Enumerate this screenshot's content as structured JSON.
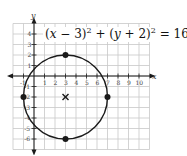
{
  "chart_data": {
    "type": "scatter",
    "equation": {
      "parts": [
        "(",
        "x",
        " − 3)",
        "2",
        " + (",
        "y",
        " + 2)",
        "2",
        " = 16"
      ]
    },
    "xlabel": "x",
    "ylabel": "y",
    "xlim": [
      -2,
      11
    ],
    "ylim": [
      -7,
      5
    ],
    "grid": true,
    "x_ticks": [
      -1,
      1,
      2,
      3,
      4,
      5,
      6,
      7,
      8,
      9,
      10
    ],
    "x_tick_labels": [
      "-1",
      "1",
      "2",
      "3",
      "4",
      "5",
      "6",
      "7",
      "8",
      "9",
      "10"
    ],
    "y_ticks": [
      4,
      3,
      2,
      1,
      -1,
      -2,
      -3,
      -4,
      -5,
      -6
    ],
    "y_tick_labels": [
      "4",
      "3",
      "2",
      "1",
      "-1",
      "-2",
      "-3",
      "-4",
      "-5",
      "-6"
    ],
    "circle": {
      "center": [
        3,
        -2
      ],
      "radius": 4
    },
    "center_marker": {
      "x": 3,
      "y": -2,
      "symbol": "x"
    },
    "points": [
      {
        "x": 3,
        "y": 2
      },
      {
        "x": 7,
        "y": -2
      },
      {
        "x": 3,
        "y": -6
      },
      {
        "x": -1,
        "y": -2
      }
    ],
    "colors": {
      "grid": "#c8c8c8",
      "curve": "#1a1a1a",
      "axis": "#1a1a1a"
    }
  }
}
